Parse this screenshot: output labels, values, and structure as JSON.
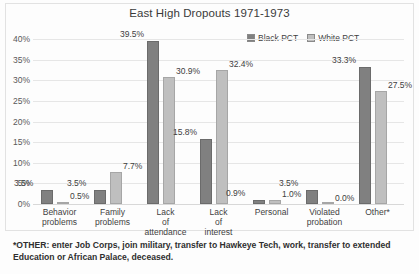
{
  "chart_data": {
    "type": "bar",
    "title": "East High Dropouts 1971-1973",
    "xlabel": "",
    "ylabel": "",
    "ylim": [
      0,
      40
    ],
    "ytick_step": 5,
    "ytick_labels": [
      "0%",
      "5%",
      "10%",
      "15%",
      "20%",
      "25%",
      "30%",
      "35%",
      "40%"
    ],
    "grid": true,
    "legend_position": "top-right",
    "categories": [
      "Behavior problems",
      "Family problems",
      "Lack of attendance",
      "Lack of interest",
      "Personal",
      "Violated probation",
      "Other*"
    ],
    "series": [
      {
        "name": "Black PCT",
        "color": "#808080",
        "values": [
          3.5,
          3.5,
          39.5,
          15.8,
          0.9,
          3.5,
          33.3
        ],
        "labels": [
          "3.5%",
          "3.5%",
          "39.5%",
          "15.8%",
          "0.9%",
          "3.5%",
          "33.3%"
        ]
      },
      {
        "name": "White PCT",
        "color": "#bfbfbf",
        "values": [
          0.5,
          7.7,
          30.9,
          32.4,
          1.0,
          0.0,
          27.5
        ],
        "labels": [
          "0.5%",
          "7.7%",
          "30.9%",
          "32.4%",
          "1.0%",
          "0.0%",
          "27.5%"
        ]
      }
    ],
    "footnote": "*OTHER: enter Job Corps, join military, transfer to Hawkeye Tech, work, transfer to extended Education or African Palace, deceased."
  }
}
